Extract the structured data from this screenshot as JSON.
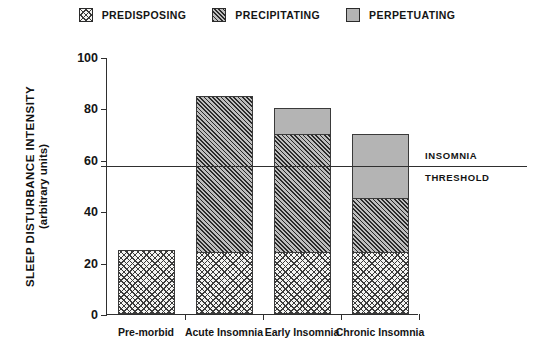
{
  "legend": {
    "items": [
      {
        "label": "PREDISPOSING",
        "swatch": "crosshatch-dotted-swatch",
        "fill": "fill-predisposing",
        "color": "#f4f4f2"
      },
      {
        "label": "PRECIPITATING",
        "swatch": "diagonal-hatch-swatch",
        "fill": "fill-precipitating",
        "color": "#6e6e6e"
      },
      {
        "label": "PERPETUATING",
        "swatch": "solid-gray-swatch",
        "fill": "fill-perpetuating",
        "color": "#b4b4b4"
      }
    ]
  },
  "annotations": {
    "threshold_line_1": "INSOMNIA",
    "threshold_line_2": "THRESHOLD",
    "threshold_value": 58
  },
  "axis": {
    "y_title_line1": "SLEEP DISTURBANCE INTENSITY",
    "y_title_line2": "(arbitrary units)",
    "y_ticks": [
      "0",
      "20",
      "40",
      "60",
      "80",
      "100"
    ]
  },
  "chart_data": {
    "type": "bar",
    "title": "",
    "subtitle": "",
    "xlabel": "",
    "ylabel": "SLEEP DISTURBANCE INTENSITY (arbitrary units)",
    "ylim": [
      0,
      100
    ],
    "yticks": [
      0,
      20,
      40,
      60,
      80,
      100
    ],
    "grid": false,
    "stacked": true,
    "legend_position": "top-center",
    "categories": [
      "Pre-morbid",
      "Acute Insomnia",
      "Early Insomnia",
      "Chronic Insomnia"
    ],
    "series": [
      {
        "name": "PREDISPOSING",
        "values": [
          25,
          24,
          24,
          24
        ]
      },
      {
        "name": "PRECIPITATING",
        "values": [
          0,
          61,
          46,
          21
        ]
      },
      {
        "name": "PERPETUATING",
        "values": [
          0,
          0,
          10,
          25
        ]
      }
    ],
    "totals": [
      25,
      85,
      80,
      70
    ],
    "annotations": [
      {
        "type": "hline",
        "value": 58,
        "label": "INSOMNIA THRESHOLD"
      }
    ]
  }
}
